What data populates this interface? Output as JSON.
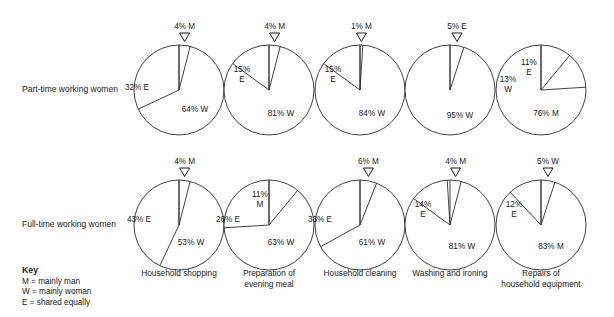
{
  "rows": [
    {
      "id": "part-time",
      "label": "Part-time working women",
      "cy": 90
    },
    {
      "id": "full-time",
      "label": "Full-time working women",
      "cy": 225
    }
  ],
  "key": {
    "title": "Key",
    "lines": [
      "M = mainly man",
      "W = mainly woman",
      "E = shared equally"
    ]
  },
  "categories": [
    {
      "label": "Household shopping",
      "cx": 179
    },
    {
      "label": "Preparation of\nevening meal",
      "cx": 269
    },
    {
      "label": "Household cleaning",
      "cx": 360
    },
    {
      "label": "Washing and ironing",
      "cx": 450
    },
    {
      "label": "Repairs of\nhousehold equipment",
      "cx": 541
    }
  ],
  "style": {
    "radius": 45,
    "stroke": "#2b2b2b",
    "fill": "#ffffff",
    "text": "#1a1a1a"
  },
  "chart_data": {
    "type": "pie",
    "title": "",
    "subtitle": "",
    "legend": {
      "position": "bottom-left",
      "title": "Key",
      "entries": [
        "M = mainly man",
        "W = mainly woman",
        "E = shared equally"
      ]
    },
    "categories": [
      "Household shopping",
      "Preparation of evening meal",
      "Household cleaning",
      "Washing and ironing",
      "Repairs of household equipment"
    ],
    "groups": [
      "Part-time working women",
      "Full-time working women"
    ],
    "units": "percent",
    "pies": [
      {
        "group": "Part-time working women",
        "category": "Household shopping",
        "cx": 179,
        "cy": 90,
        "r": 45,
        "slices": [
          {
            "label": "4% M",
            "value": 4,
            "code": "M",
            "callout": true,
            "tx": 0,
            "ty": 0
          },
          {
            "label": "64% W",
            "value": 64,
            "code": "W",
            "callout": false,
            "tx": 16,
            "ty": 22
          },
          {
            "label": "32% E",
            "value": 32,
            "code": "E",
            "callout": false,
            "tx": -42,
            "ty": 0
          }
        ]
      },
      {
        "group": "Part-time working women",
        "category": "Preparation of evening meal",
        "cx": 269,
        "cy": 90,
        "r": 45,
        "slices": [
          {
            "label": "4% M",
            "value": 4,
            "code": "M",
            "callout": true,
            "tx": 0,
            "ty": 0
          },
          {
            "label": "81% W",
            "value": 81,
            "code": "W",
            "callout": false,
            "tx": 12,
            "ty": 26
          },
          {
            "label": "15%\nE",
            "value": 15,
            "code": "E",
            "callout": false,
            "tx": -27,
            "ty": -18
          }
        ]
      },
      {
        "group": "Part-time working women",
        "category": "Household cleaning",
        "cx": 360,
        "cy": 90,
        "r": 45,
        "slices": [
          {
            "label": "1% M",
            "value": 1,
            "code": "M",
            "callout": true,
            "tx": 0,
            "ty": 0
          },
          {
            "label": "84% W",
            "value": 84,
            "code": "W",
            "callout": false,
            "tx": 12,
            "ty": 26
          },
          {
            "label": "15%\nE",
            "value": 15,
            "code": "E",
            "callout": false,
            "tx": -27,
            "ty": -18
          }
        ]
      },
      {
        "group": "Part-time working women",
        "category": "Washing and ironing",
        "cx": 450,
        "cy": 90,
        "r": 45,
        "slices": [
          {
            "label": "5% E",
            "value": 5,
            "code": "E",
            "callout": true,
            "tx": 0,
            "ty": 0
          },
          {
            "label": "95% W",
            "value": 95,
            "code": "W",
            "callout": false,
            "tx": 10,
            "ty": 28
          }
        ]
      },
      {
        "group": "Part-time working women",
        "category": "Repairs of household equipment",
        "cx": 541,
        "cy": 90,
        "r": 45,
        "slices": [
          {
            "label": "11%\nE",
            "value": 11,
            "code": "E",
            "callout": false,
            "tx": -12,
            "ty": -25
          },
          {
            "label": "13%\nW",
            "value": 13,
            "code": "W",
            "callout": false,
            "tx": -33,
            "ty": -8
          },
          {
            "label": "76% M",
            "value": 76,
            "code": "M",
            "callout": false,
            "tx": 5,
            "ty": 26
          }
        ]
      },
      {
        "group": "Full-time working women",
        "category": "Household shopping",
        "cx": 179,
        "cy": 225,
        "r": 45,
        "slices": [
          {
            "label": "4% M",
            "value": 4,
            "code": "M",
            "callout": true,
            "tx": 0,
            "ty": 0
          },
          {
            "label": "53% W",
            "value": 53,
            "code": "W",
            "callout": false,
            "tx": 12,
            "ty": 20
          },
          {
            "label": "43% E",
            "value": 43,
            "code": "E",
            "callout": false,
            "tx": -40,
            "ty": -3
          }
        ]
      },
      {
        "group": "Full-time working women",
        "category": "Preparation of evening meal",
        "cx": 269,
        "cy": 225,
        "r": 45,
        "slices": [
          {
            "label": "11%\nM",
            "value": 11,
            "code": "M",
            "callout": false,
            "tx": -9,
            "ty": -28
          },
          {
            "label": "63% W",
            "value": 63,
            "code": "W",
            "callout": false,
            "tx": 12,
            "ty": 20
          },
          {
            "label": "26% E",
            "value": 26,
            "code": "E",
            "callout": false,
            "tx": -41,
            "ty": -3
          }
        ]
      },
      {
        "group": "Full-time working women",
        "category": "Household cleaning",
        "cx": 360,
        "cy": 225,
        "r": 45,
        "slices": [
          {
            "label": "6% M",
            "value": 6,
            "code": "M",
            "callout": true,
            "tx": 0,
            "ty": 0
          },
          {
            "label": "61% W",
            "value": 61,
            "code": "W",
            "callout": false,
            "tx": 12,
            "ty": 20
          },
          {
            "label": "33% E",
            "value": 33,
            "code": "E",
            "callout": false,
            "tx": -40,
            "ty": -3
          }
        ]
      },
      {
        "group": "Full-time working women",
        "category": "Washing and ironing",
        "cx": 450,
        "cy": 225,
        "r": 45,
        "slices": [
          {
            "label": "4% M",
            "value": 4,
            "code": "M",
            "callout": true,
            "tx": 0,
            "ty": 0
          },
          {
            "label": "81% W",
            "value": 81,
            "code": "W",
            "callout": false,
            "tx": 12,
            "ty": 24
          },
          {
            "label": "14%\nE",
            "value": 14,
            "code": "E",
            "callout": false,
            "tx": -27,
            "ty": -18
          }
        ]
      },
      {
        "group": "Full-time working women",
        "category": "Repairs of household equipment",
        "cx": 541,
        "cy": 225,
        "r": 45,
        "slices": [
          {
            "label": "5% W",
            "value": 5,
            "code": "W",
            "callout": true,
            "tx": 0,
            "ty": 0
          },
          {
            "label": "83% M",
            "value": 83,
            "code": "M",
            "callout": false,
            "tx": 10,
            "ty": 24
          },
          {
            "label": "12%\nE",
            "value": 12,
            "code": "E",
            "callout": false,
            "tx": -27,
            "ty": -18
          }
        ]
      }
    ]
  }
}
